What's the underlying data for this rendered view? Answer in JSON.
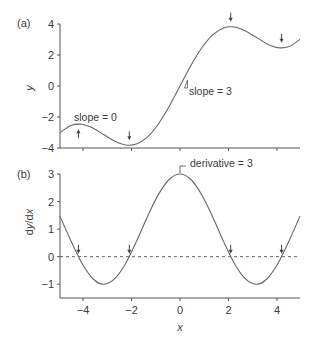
{
  "chart_data": [
    {
      "type": "line",
      "panel_label": "(a)",
      "title": "",
      "xlabel": "",
      "ylabel": "y",
      "xlim": [
        -4.95,
        4.95
      ],
      "ylim": [
        -4,
        4
      ],
      "yticks": [
        4,
        2,
        0,
        -2,
        -4
      ],
      "xticks": [
        -4,
        -2,
        0,
        2,
        4
      ],
      "grid": false,
      "function": "y = x + 2 sin(x)",
      "series": [
        {
          "name": "y",
          "x": [
            -4.95,
            -4.5,
            -4.05,
            -3.6,
            -3.15,
            -2.7,
            -2.25,
            -1.8,
            -1.35,
            -0.9,
            -0.45,
            0,
            0.45,
            0.9,
            1.35,
            1.8,
            2.25,
            2.7,
            3.15,
            3.6,
            4.05,
            4.5,
            4.95
          ],
          "values": [
            -3.006,
            -2.545,
            -2.473,
            -2.715,
            -3.133,
            -3.555,
            -3.806,
            -3.748,
            -3.301,
            -2.467,
            -1.32,
            0,
            1.32,
            2.467,
            3.301,
            3.748,
            3.806,
            3.555,
            3.133,
            2.715,
            2.473,
            2.545,
            3.006
          ]
        }
      ],
      "annotations": [
        {
          "text": "slope = 0",
          "x": -4.19,
          "y": -2.46,
          "marker": "up-arrow"
        },
        {
          "text": "",
          "x": -2.09,
          "y": -3.83,
          "marker": "down-arrow"
        },
        {
          "text": "",
          "x": 2.09,
          "y": 3.83,
          "marker": "down-arrow"
        },
        {
          "text": "",
          "x": 4.19,
          "y": 2.46,
          "marker": "down-arrow"
        },
        {
          "text": "slope = 3",
          "x": 0.9,
          "y": 2.0,
          "marker": "slope-triangle"
        }
      ]
    },
    {
      "type": "line",
      "panel_label": "(b)",
      "title": "",
      "xlabel": "x",
      "ylabel": "dy/dx",
      "xlim": [
        -4.95,
        4.95
      ],
      "ylim": [
        -1.5,
        3
      ],
      "yticks": [
        3,
        2,
        1,
        0,
        -1
      ],
      "xticks": [
        -4,
        -2,
        0,
        2,
        4
      ],
      "grid": false,
      "function": "dy/dx = 1 + 2 cos(x)",
      "reference_line": {
        "y": 0,
        "style": "dashed"
      },
      "series": [
        {
          "name": "dy/dx",
          "x": [
            -4.95,
            -4.5,
            -4.05,
            -3.6,
            -3.15,
            -2.7,
            -2.25,
            -1.8,
            -1.35,
            -0.9,
            -0.45,
            0,
            0.45,
            0.9,
            1.35,
            1.8,
            2.25,
            2.7,
            3.15,
            3.6,
            4.05,
            4.5,
            4.95
          ],
          "values": [
            1.47,
            0.578,
            -0.23,
            -0.794,
            -1.0,
            -0.808,
            -0.256,
            0.546,
            1.438,
            2.243,
            2.801,
            3.0,
            2.801,
            2.243,
            1.438,
            0.546,
            -0.256,
            -0.808,
            -1.0,
            -0.794,
            -0.23,
            0.578,
            1.47
          ]
        }
      ],
      "annotations": [
        {
          "text": "derivative = 3",
          "x": 0,
          "y": 3,
          "marker": "bracket"
        },
        {
          "text": "",
          "x": -4.19,
          "y": 0,
          "marker": "down-arrow"
        },
        {
          "text": "",
          "x": -2.09,
          "y": 0,
          "marker": "down-arrow"
        },
        {
          "text": "",
          "x": 2.09,
          "y": 0,
          "marker": "down-arrow"
        },
        {
          "text": "",
          "x": 4.19,
          "y": 0,
          "marker": "down-arrow"
        }
      ]
    }
  ],
  "labels": {
    "panel_a": "(a)",
    "panel_b": "(b)",
    "ylabel_a": "y",
    "ylabel_b_d1": "d",
    "ylabel_b_y": "y",
    "ylabel_b_slash": "/d",
    "ylabel_b_x": "x",
    "xlabel_b": "x",
    "anno_slope0": "slope = 0",
    "anno_slope3": "slope = 3",
    "anno_deriv3": "derivative = 3"
  }
}
